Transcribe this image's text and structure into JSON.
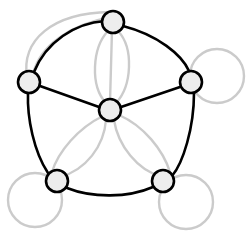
{
  "figure": {
    "background_color": "#ffffff",
    "width": 252,
    "height": 231
  },
  "style": {
    "node_fill": "#ededed",
    "node_stroke": "#000000",
    "node_radius": 11,
    "node_stroke_width": 2.6,
    "primary_edge_color": "#000000",
    "primary_edge_width": 2.6,
    "secondary_edge_color": "#cbcbcb",
    "secondary_edge_width": 2.4
  },
  "chart_data": {
    "type": "diagram",
    "title": "",
    "nodes": [
      {
        "id": "top",
        "label": "",
        "x": 113,
        "y": 22
      },
      {
        "id": "left",
        "label": "",
        "x": 29,
        "y": 82
      },
      {
        "id": "right",
        "label": "",
        "x": 191,
        "y": 82
      },
      {
        "id": "center",
        "label": "",
        "x": 110,
        "y": 110
      },
      {
        "id": "bottom-left",
        "label": "",
        "x": 57,
        "y": 181
      },
      {
        "id": "bottom-right",
        "label": "",
        "x": 163,
        "y": 181
      }
    ],
    "primary_edges": [
      {
        "from": "left",
        "to": "center",
        "shape": "straight"
      },
      {
        "from": "right",
        "to": "center",
        "shape": "straight"
      },
      {
        "from": "top",
        "to": "right",
        "shape": "arc-outer"
      },
      {
        "from": "left",
        "to": "bottom-left",
        "shape": "arc-outer"
      },
      {
        "from": "bottom-left",
        "to": "bottom-right",
        "shape": "arc-outer"
      },
      {
        "from": "bottom-right",
        "to": "right",
        "shape": "arc-outer"
      },
      {
        "from": "left",
        "to": "top",
        "shape": "arc-outer"
      }
    ],
    "secondary_edges": [
      {
        "from": "top",
        "to": "center",
        "shape": "straight"
      },
      {
        "from": "top",
        "to": "center",
        "shape": "arc-left"
      },
      {
        "from": "top",
        "to": "center",
        "shape": "arc-right"
      },
      {
        "from": "left",
        "to": "top",
        "shape": "arc-outer-1"
      },
      {
        "from": "left",
        "to": "top",
        "shape": "arc-outer-2"
      },
      {
        "from": "center",
        "to": "bottom-left",
        "shape": "arc-left"
      },
      {
        "from": "center",
        "to": "bottom-left",
        "shape": "arc-right"
      },
      {
        "from": "center",
        "to": "bottom-right",
        "shape": "arc-left"
      },
      {
        "from": "center",
        "to": "bottom-right",
        "shape": "arc-right"
      }
    ],
    "self_loops": [
      {
        "node": "right",
        "direction": "east",
        "radius": 29
      },
      {
        "node": "bottom-left",
        "direction": "southwest",
        "radius": 29
      },
      {
        "node": "bottom-right",
        "direction": "southeast",
        "radius": 29
      }
    ],
    "counts": {
      "nodes": 6,
      "primary_edges": 7,
      "secondary_edges": 9,
      "self_loops": 3
    }
  }
}
